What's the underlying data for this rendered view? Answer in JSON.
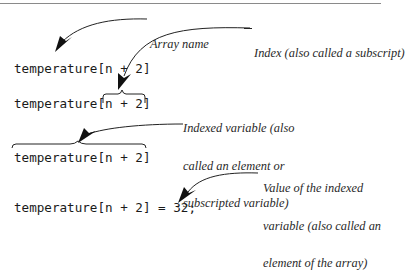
{
  "figure": {
    "code_lines": [
      "temperature[n + 2]",
      "temperature[n + 2]",
      "temperature[n + 2]",
      "temperature[n + 2] = 32;"
    ],
    "annotations": [
      {
        "id": "array-name",
        "lines": [
          "Array name"
        ]
      },
      {
        "id": "index",
        "lines": [
          "Index (also called a subscript)"
        ]
      },
      {
        "id": "indexed-variable",
        "lines": [
          "Indexed variable (also",
          "called an element or",
          "subscripted variable)"
        ]
      },
      {
        "id": "value",
        "lines": [
          "Value of the indexed",
          "variable (also called an",
          "element of the array)"
        ]
      }
    ],
    "colors": {
      "rule": "#8a8a8a",
      "text": "#1a1a1a",
      "arrow": "#1a1a1a"
    }
  }
}
